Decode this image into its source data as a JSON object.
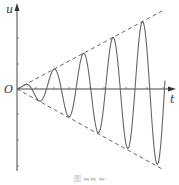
{
  "figure": {
    "axes": {
      "x_label": "t",
      "y_label": "u",
      "origin_label": "O"
    },
    "caption": "图 ",
    "colors": {
      "axis": "#444444",
      "wave": "#666666",
      "envelope": "#555555"
    },
    "curve": {
      "type": "growing-sinusoid",
      "description": "u = k·t·sin(ωt), amplitude grows linearly between dashed envelope lines",
      "periods_visible": 5.5
    },
    "envelope": {
      "style": "dashed",
      "upper": "u = +k·t",
      "lower": "u = -k·t"
    }
  }
}
